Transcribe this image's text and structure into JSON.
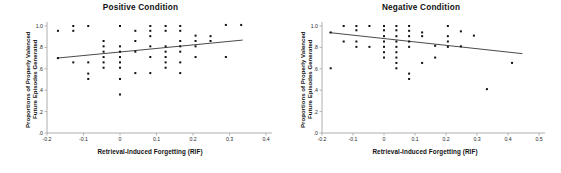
{
  "figure": {
    "shared_xlabel": "Retrieval-Induced Forgetting (RIF)",
    "shared_ylabel_line1": "Proportions of Properly Valenced",
    "shared_ylabel_line2": "Future Episodes Generated",
    "marker_color": "#111111",
    "line_color": "#4a4a4a",
    "axis_color": "#9a9a9a"
  },
  "chart_data": [
    {
      "type": "scatter",
      "title": "Positive Condition",
      "xlabel": "Retrieval-Induced Forgetting (RIF)",
      "ylabel": "Proportions of Properly Valenced Future Episodes Generated",
      "xlim": [
        -0.2,
        0.4
      ],
      "ylim": [
        0.0,
        1.0
      ],
      "xticks": [
        -0.2,
        -0.1,
        0,
        0.1,
        0.2,
        0.3,
        0.4
      ],
      "xticklabels": [
        "-0.2",
        "-0.1",
        "0",
        "0.1",
        "0.2",
        "0.3",
        "0.4"
      ],
      "yticks": [
        0.0,
        0.2,
        0.4,
        0.6,
        0.8,
        1.0
      ],
      "yticklabels": [
        ".0",
        ".2",
        ".4",
        ".6",
        ".8",
        "1.0"
      ],
      "grid": false,
      "legend": "none",
      "x": [
        -0.17,
        -0.17,
        -0.128,
        -0.128,
        -0.128,
        -0.087,
        -0.087,
        -0.087,
        -0.087,
        -0.045,
        -0.045,
        -0.045,
        -0.045,
        -0.045,
        -0.045,
        0.0,
        0.0,
        0.0,
        0.0,
        0.0,
        0.0,
        0.0,
        0.0,
        0.042,
        0.042,
        0.042,
        0.042,
        0.083,
        0.083,
        0.083,
        0.083,
        0.083,
        0.083,
        0.125,
        0.125,
        0.125,
        0.125,
        0.125,
        0.125,
        0.125,
        0.165,
        0.165,
        0.165,
        0.165,
        0.165,
        0.165,
        0.165,
        0.207,
        0.207,
        0.207,
        0.207,
        0.248,
        0.248,
        0.29,
        0.29,
        0.332
      ],
      "y": [
        0.955,
        0.7,
        1.0,
        0.955,
        0.66,
        1.0,
        0.66,
        0.555,
        0.505,
        0.86,
        0.81,
        0.76,
        0.71,
        0.66,
        0.61,
        1.0,
        0.81,
        0.76,
        0.71,
        0.66,
        0.61,
        0.505,
        0.36,
        0.955,
        0.86,
        0.76,
        0.56,
        1.0,
        0.955,
        0.905,
        0.81,
        0.71,
        0.56,
        1.0,
        0.955,
        0.81,
        0.76,
        0.71,
        0.66,
        0.61,
        1.0,
        0.955,
        0.86,
        0.81,
        0.76,
        0.66,
        0.56,
        0.91,
        0.86,
        0.81,
        0.71,
        0.905,
        0.86,
        1.01,
        0.71,
        1.01
      ],
      "fit_line": {
        "x0": -0.172,
        "y0": 0.7,
        "x1": 0.335,
        "y1": 0.868
      }
    },
    {
      "type": "scatter",
      "title": "Negative Condition",
      "xlabel": "Retrieval-Induced Forgetting (RIF)",
      "ylabel": "Proportions of Properly Valenced Future Episodes Generated",
      "xlim": [
        -0.2,
        0.5
      ],
      "ylim": [
        0.0,
        1.0
      ],
      "xticks": [
        -0.2,
        -0.1,
        0,
        0.1,
        0.2,
        0.3,
        0.4,
        0.5
      ],
      "xticklabels": [
        "-0.2",
        "-0.1",
        "0",
        "0.1",
        "0.2",
        "0.3",
        "0.4",
        "0.5"
      ],
      "yticks": [
        0.0,
        0.2,
        0.4,
        0.6,
        0.8,
        1.0
      ],
      "yticklabels": [
        ".0",
        ".2",
        ".4",
        ".6",
        ".8",
        "1.0"
      ],
      "grid": false,
      "legend": "none",
      "x": [
        -0.172,
        -0.172,
        -0.13,
        -0.13,
        -0.089,
        -0.089,
        -0.089,
        -0.089,
        -0.047,
        -0.047,
        0.0,
        0.0,
        0.0,
        0.0,
        0.0,
        0.0,
        0.0,
        0.04,
        0.04,
        0.04,
        0.04,
        0.04,
        0.04,
        0.04,
        0.04,
        0.04,
        0.081,
        0.081,
        0.081,
        0.081,
        0.081,
        0.081,
        0.081,
        0.123,
        0.123,
        0.123,
        0.165,
        0.165,
        0.206,
        0.206,
        0.206,
        0.206,
        0.248,
        0.248,
        0.29,
        0.332,
        0.413
      ],
      "y": [
        0.94,
        0.605,
        1.0,
        0.855,
        1.0,
        0.96,
        0.855,
        0.805,
        1.0,
        0.805,
        1.0,
        0.96,
        0.905,
        0.855,
        0.805,
        0.755,
        0.705,
        1.0,
        0.96,
        0.905,
        0.855,
        0.805,
        0.755,
        0.705,
        0.655,
        0.605,
        1.0,
        0.955,
        0.905,
        0.855,
        0.805,
        0.555,
        0.505,
        0.94,
        0.905,
        0.655,
        0.815,
        0.705,
        1.0,
        0.905,
        0.855,
        0.805,
        0.95,
        0.81,
        0.91,
        0.41,
        0.655
      ],
      "fit_line": {
        "x0": -0.175,
        "y0": 0.938,
        "x1": 0.445,
        "y1": 0.742
      }
    }
  ]
}
